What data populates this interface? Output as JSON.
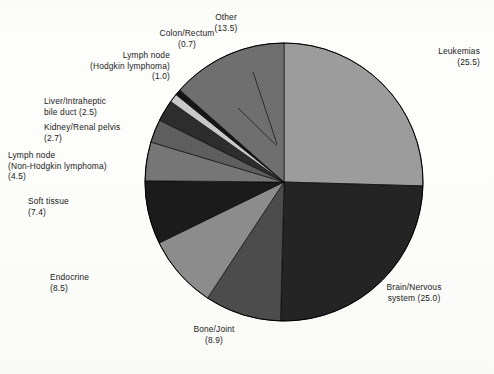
{
  "chart_data": {
    "type": "pie",
    "title": "",
    "subtitle": "",
    "xlabel": "",
    "ylabel": "",
    "legend_position": "none",
    "grid": false,
    "units": "percent",
    "start_angle_deg": 0,
    "direction": "counterclockwise",
    "categories": [
      "Leukemias",
      "Brain/Nervous system",
      "Bone/Joint",
      "Endocrine",
      "Soft tissue",
      "Lymph node (Non-Hodgkin lymphoma)",
      "Kidney/Renal pelvis",
      "Liver/Intraheptic bile duct",
      "Lymph node (Hodgkin lymphoma)",
      "Colon/Rectum",
      "Other"
    ],
    "values": [
      25.5,
      25.0,
      8.9,
      8.5,
      7.4,
      4.5,
      2.7,
      2.5,
      1.0,
      0.7,
      13.5
    ],
    "colors": [
      "#9c9c9c",
      "#242424",
      "#4c4c4c",
      "#8c8c8c",
      "#1b1b1b",
      "#767676",
      "#5e5e5e",
      "#2d2d2d",
      "#c9c9c9",
      "#141414",
      "#6f6f6f"
    ],
    "slices": [
      {
        "label": "Leukemias",
        "value": 25.5,
        "value_text": "(25.5)",
        "color": "#9c9c9c"
      },
      {
        "label": "Brain/Nervous system",
        "value": 25.0,
        "value_text": "(25.0)",
        "color": "#242424"
      },
      {
        "label": "Bone/Joint",
        "value": 8.9,
        "value_text": "(8.9)",
        "color": "#4c4c4c"
      },
      {
        "label": "Endocrine",
        "value": 8.5,
        "value_text": "(8.5)",
        "color": "#8c8c8c"
      },
      {
        "label": "Soft tissue",
        "value": 7.4,
        "value_text": "(7.4)",
        "color": "#1b1b1b"
      },
      {
        "label": "Lymph node (Non-Hodgkin lymphoma)",
        "value": 4.5,
        "value_text": "(4.5)",
        "color": "#767676"
      },
      {
        "label": "Kidney/Renal pelvis",
        "value": 2.7,
        "value_text": "(2.7)",
        "color": "#5e5e5e"
      },
      {
        "label": "Liver/Intraheptic bile duct",
        "value": 2.5,
        "value_text": "(2.5)",
        "color": "#2d2d2d"
      },
      {
        "label": "Lymph node (Hodgkin lymphoma)",
        "value": 1.0,
        "value_text": "(1.0)",
        "color": "#c9c9c9"
      },
      {
        "label": "Colon/Rectum",
        "value": 0.7,
        "value_text": "(0.7)",
        "color": "#141414"
      },
      {
        "label": "Other",
        "value": 13.5,
        "value_text": "(13.5)",
        "color": "#6f6f6f"
      }
    ]
  },
  "labels": {
    "leukemias": "Leukemias\n(25.5)",
    "brain": "Brain/Nervous\nsystem (25.0)",
    "bone_joint": "Bone/Joint\n(8.9)",
    "endocrine": "Endocrine\n(8.5)",
    "soft_tissue": "Soft tissue\n(7.4)",
    "lymph_non_hodgkin": "Lymph node\n(Non-Hodgkin lymphoma)\n(4.5)",
    "kidney": "Kidney/Renal pelvis\n(2.7)",
    "liver": "Liver/Intraheptic\nbile duct (2.5)",
    "lymph_hodgkin": "Lymph node\n(Hodgkin lymphoma)\n(1.0)",
    "colon_rectum": "Colon/Rectum\n(0.7)",
    "other": "Other\n(13.5)"
  },
  "geometry": {
    "center_x": 284,
    "center_y": 182,
    "radius": 139
  },
  "style": {
    "background": "#fdfdfb",
    "outline": "#000000",
    "text_color": "#1a1a1a"
  }
}
